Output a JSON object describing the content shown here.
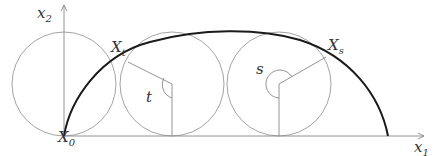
{
  "diagram": {
    "labels": {
      "x2_axis": {
        "base": "x",
        "sub": "2"
      },
      "x1_axis": {
        "base": "x",
        "sub": "1"
      },
      "origin": {
        "base": "X",
        "sub": "0"
      },
      "point_t": {
        "base": "X",
        "sub": "t"
      },
      "point_s": {
        "base": "X",
        "sub": "s"
      },
      "angle_t": "t",
      "angle_s": "s"
    },
    "colors": {
      "curve": "#1a1a1a",
      "circle": "#9a9a9a",
      "axis": "#888888",
      "label": "#333333"
    }
  }
}
